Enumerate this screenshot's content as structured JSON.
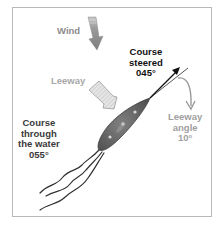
{
  "diagram": {
    "labels": {
      "wind": "Wind",
      "leeway": "Leeway",
      "course_steered": [
        "Course",
        "steered",
        "045°"
      ],
      "course_through_water": [
        "Course",
        "through",
        "the water",
        "055°"
      ],
      "leeway_angle": [
        "Leeway",
        "angle",
        "10°"
      ]
    },
    "values": {
      "course_steered_deg": 45,
      "course_through_water_deg": 55,
      "leeway_angle_deg": 10
    },
    "colors": {
      "frame": "#b8b8b8",
      "wind_arrow": "#8a8a8a",
      "leeway_arrow_fill": "#e2e2e2",
      "boat_hull": "#6a6a6a",
      "wake_lines": "#333333",
      "steered_arrow": "#111111",
      "leeway_angle_arrow": "#9a9a9a"
    }
  }
}
